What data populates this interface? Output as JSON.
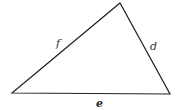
{
  "diagram": {
    "type": "triangle",
    "vertices": {
      "left": [
        12,
        93
      ],
      "top": [
        120,
        3
      ],
      "right": [
        170,
        94
      ]
    },
    "sides": [
      {
        "id": "f",
        "label": "f",
        "from": "left",
        "to": "top"
      },
      {
        "id": "d",
        "label": "d",
        "from": "top",
        "to": "right"
      },
      {
        "id": "e",
        "label": "e",
        "from": "left",
        "to": "right"
      }
    ],
    "stroke_color": "#222222",
    "label_color": "#333333"
  }
}
